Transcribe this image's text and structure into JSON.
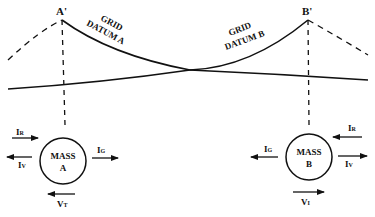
{
  "towers": {
    "a": {
      "label": "A'"
    },
    "b": {
      "label": "B'"
    }
  },
  "curves": {
    "grid_a": {
      "line1": "GRID",
      "line2": "DATUM A"
    },
    "grid_b": {
      "line1": "GRID",
      "line2": "DATUM B"
    }
  },
  "masses": {
    "a": {
      "line1": "MASS",
      "line2": "A",
      "arrows": {
        "ir": "I",
        "ir_sub": "R",
        "iv": "I",
        "iv_sub": "V",
        "ig": "I",
        "ig_sub": "G",
        "vt": "V",
        "vt_sub": "T"
      }
    },
    "b": {
      "line1": "MASS",
      "line2": "B",
      "arrows": {
        "ir": "I",
        "ir_sub": "R",
        "iv": "I",
        "iv_sub": "V",
        "ig": "I",
        "ig_sub": "G",
        "vi": "V",
        "vi_sub": "I"
      }
    }
  },
  "colors": {
    "ink": "#111111",
    "background": "#ffffff"
  }
}
